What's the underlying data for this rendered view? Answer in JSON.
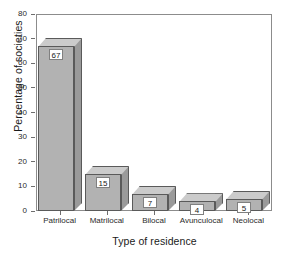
{
  "chart_data": {
    "type": "bar",
    "title": "",
    "subtitle": "",
    "xlabel": "Type of residence",
    "ylabel": "Percentage of societies",
    "categories": [
      "Patrilocal",
      "Matrilocal",
      "Bilocal",
      "Avunculocal",
      "Neolocal"
    ],
    "values": [
      67,
      15,
      7,
      4,
      5
    ],
    "data_labels": [
      "67",
      "15",
      "7",
      "4",
      "5"
    ],
    "ylim": [
      0,
      80
    ],
    "yticks": [
      0,
      10,
      20,
      30,
      40,
      50,
      60,
      70,
      80
    ],
    "ytick_labels": [
      "0",
      "10",
      "20",
      "30",
      "40",
      "50",
      "60",
      "70",
      "80"
    ],
    "grid": false,
    "legend": null,
    "style": "3d-bars",
    "colors": {
      "bar_front": "#b2b2b2",
      "bar_top": "#cbcbcb",
      "bar_side": "#9a9a9a",
      "bar_edge": "#5a5a5a",
      "axis": "#8c8c8c",
      "text": "#1a1a1a",
      "label_box_bg": "#ffffff",
      "background": "#ffffff"
    }
  }
}
